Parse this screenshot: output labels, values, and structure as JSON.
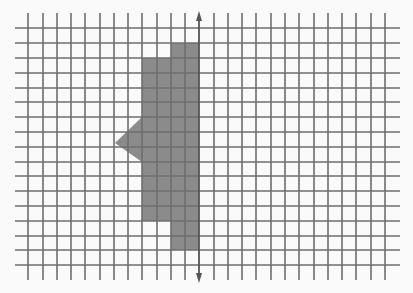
{
  "diagram": {
    "type": "grid-reflection-figure",
    "canvas": {
      "width": 413,
      "height": 293,
      "background": "#fafafa"
    },
    "grid": {
      "vertical_lines_x": [
        28,
        43,
        57,
        71,
        85,
        100,
        114,
        128,
        142,
        157,
        171,
        185,
        214,
        228,
        242,
        256,
        271,
        285,
        299,
        314,
        328,
        342,
        356,
        371,
        385
      ],
      "vertical_y_range": [
        13,
        280
      ],
      "horizontal_lines_y": [
        28,
        43,
        58,
        73,
        88,
        102,
        117,
        132,
        147,
        162,
        176,
        191,
        206,
        221,
        236,
        250,
        265
      ],
      "horizontal_x_range": [
        15,
        400
      ],
      "line_color": "#6e6e6e",
      "line_width": 1.6
    },
    "axis": {
      "name": "line of reflection",
      "x": 199,
      "y_start": 11,
      "y_end": 283,
      "arrowheads": "both",
      "color": "#555555"
    },
    "shape": {
      "name": "gray polygon",
      "fill": "#8b8b8b",
      "points": [
        [
          171,
          43
        ],
        [
          199,
          43
        ],
        [
          199,
          250
        ],
        [
          171,
          250
        ],
        [
          171,
          221
        ],
        [
          142,
          221
        ],
        [
          142,
          162
        ],
        [
          115,
          143
        ],
        [
          142,
          117
        ],
        [
          142,
          58
        ],
        [
          171,
          58
        ]
      ]
    }
  }
}
